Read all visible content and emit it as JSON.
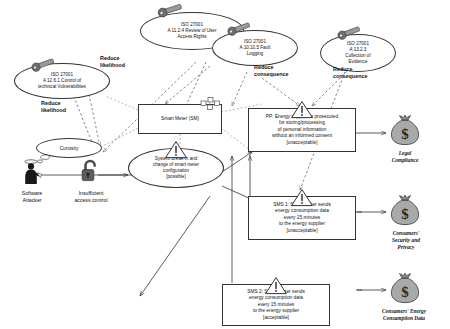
{
  "diagram": {
    "treatments": [
      {
        "id": "t1",
        "name": "iso-27001-a12-6-1",
        "line1": "ISO 27001",
        "line2": "A 12.6.1 Control of",
        "line3": "technical Vulnerabilities",
        "icon": "wrench-icon"
      },
      {
        "id": "t2",
        "name": "iso-27001-a11-2-4",
        "line1": "ISO 27001",
        "line2": "A 11.2.4 Review of User",
        "line3": "Access Rights",
        "icon": "wrench-icon"
      },
      {
        "id": "t3",
        "name": "iso-27001-a10-10-5",
        "line1": "ISO 27001",
        "line2": "A 10.10.5 Fault",
        "line3": "Logging",
        "icon": "wrench-icon"
      },
      {
        "id": "t4",
        "name": "iso-27001-a13-2-3",
        "line1": "ISO 27001",
        "line2": "A 13.2.3",
        "line3": "Collection of",
        "line4": "Evidence",
        "icon": "wrench-icon"
      }
    ],
    "treatment_labels": [
      {
        "id": "l1",
        "name": "reduce-likelihood-label-1",
        "text": "Reduce\nlikelihood"
      },
      {
        "id": "l2",
        "name": "reduce-likelihood-label-2",
        "text": "Reduce\nlikelihood"
      },
      {
        "id": "l3",
        "name": "reduce-consequence-label-1",
        "text": "Reduce\nconsequence"
      },
      {
        "id": "l4",
        "name": "reduce-consequence-label-2",
        "text": "Reduce\nconsequence"
      }
    ],
    "threat": {
      "name": "software-attacker",
      "caption_line1": "Software",
      "caption_line2": "Attacker",
      "motivation": "Curiosity",
      "icon": "human-threat-icon"
    },
    "vulnerability": {
      "name": "insufficient-access-control",
      "caption_line1": "Insufficient",
      "caption_line2": "access control",
      "icon": "open-padlock-icon"
    },
    "threat_scenario": {
      "name": "system-break-in-scenario",
      "line1": "System Break-in and",
      "line2": "change of smart meter",
      "line3": "configuration",
      "likelihood": "[possible]",
      "icon": "warning-triangle-icon"
    },
    "asset_target": {
      "name": "smart-meter-node",
      "label": "Smart Meter (SM)",
      "icon": "node-component-icon"
    },
    "unwanted_incidents": [
      {
        "id": "pp",
        "name": "unwanted-incident-pp",
        "line1": "PP: Energy supplier is prosecuted",
        "line2": "for storing/processing",
        "line3": "of personal information",
        "line4": "without an informed consent",
        "evaluation": "[unacceptable]",
        "icon": "warning-triangle-icon"
      },
      {
        "id": "sms1",
        "name": "unwanted-incident-sms1",
        "line1": "SMS 1: Smart Meter sends",
        "line2": "energy consumption data",
        "line3": "every 15 minutes",
        "line4": "to the energy supplier",
        "evaluation": "[unacceptable]",
        "icon": "warning-triangle-icon"
      },
      {
        "id": "sms2",
        "name": "unwanted-incident-sms2",
        "line1": "SMS 2: Smart Meter sends",
        "line2": "energy consumption data",
        "line3": "every 15 minutes",
        "line4": "to the energy supplier",
        "evaluation": "[acceptable]",
        "icon": "warning-triangle-icon"
      }
    ],
    "assets": [
      {
        "id": "a1",
        "name": "asset-legal-compliance",
        "line1": "Legal",
        "line2": "Compliance",
        "icon": "money-bag-icon"
      },
      {
        "id": "a2",
        "name": "asset-consumers-security-privacy",
        "line1": "Consumers'",
        "line2": "Security and",
        "line3": "Privacy",
        "icon": "money-bag-icon"
      },
      {
        "id": "a3",
        "name": "asset-consumers-energy-consumption-data",
        "line1": "Consumers' Energy",
        "line2": "Consumption Data",
        "icon": "money-bag-icon"
      }
    ],
    "colors": {
      "stroke": "#333333",
      "fill": "#ffffff",
      "icon_gray": "#808080",
      "icon_dark": "#3d3d3d"
    }
  }
}
